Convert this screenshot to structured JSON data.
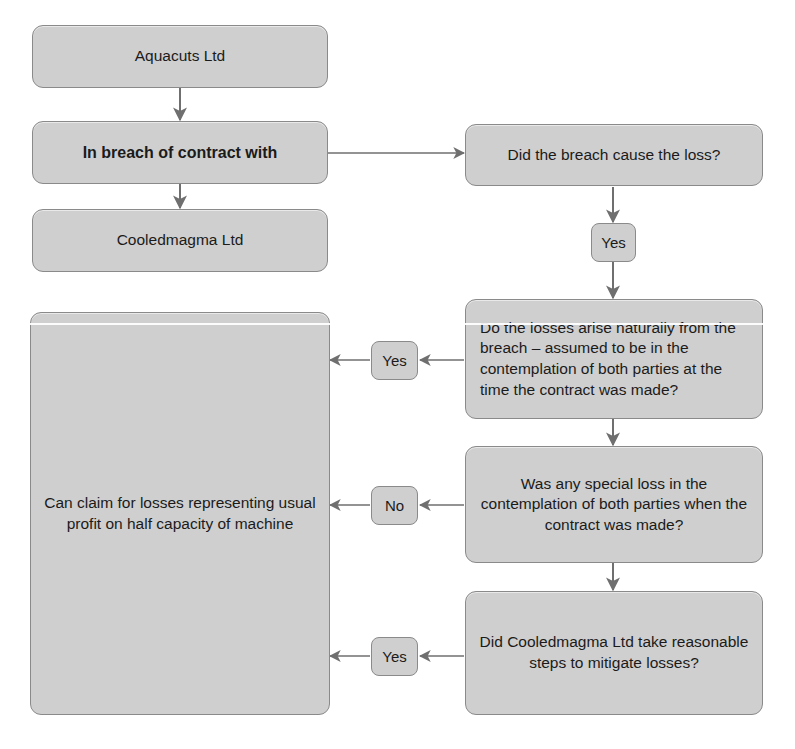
{
  "diagram": {
    "fill_color": "#cfcfcf",
    "border_color": "#8a8a8a",
    "text_color": "#1b1b1b",
    "background_color": "#ffffff",
    "nodes": [
      {
        "id": "claimant",
        "text": "Aquacuts Ltd"
      },
      {
        "id": "breach",
        "text": "In breach of contract with"
      },
      {
        "id": "defendant",
        "text": "Cooledmagma Ltd"
      },
      {
        "id": "causation",
        "text": "Did the breach cause the loss?"
      },
      {
        "id": "natural-loss",
        "text": "Do the losses arise naturally from the breach – assumed to be in the contemplation of both parties at the time the contract was made?"
      },
      {
        "id": "special-loss",
        "text": "Was any special loss in the contemplation of both parties when the contract was made?"
      },
      {
        "id": "mitigation",
        "text": "Did Cooledmagma Ltd take reasonable steps to mitigate losses?"
      },
      {
        "id": "outcome",
        "text": "Can claim for losses representing usual profit on half capacity of machine"
      }
    ],
    "edge_labels": [
      {
        "id": "yes-causation",
        "text": "Yes"
      },
      {
        "id": "yes-natural",
        "text": "Yes"
      },
      {
        "id": "no-special",
        "text": "No"
      },
      {
        "id": "yes-mitigation",
        "text": "Yes"
      }
    ]
  }
}
